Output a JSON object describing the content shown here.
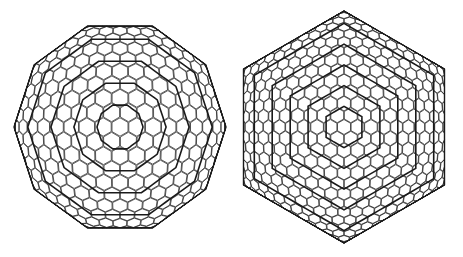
{
  "figure": {
    "background": "#ffffff",
    "line_color": "#1a1a1a",
    "panels": [
      {
        "id": "left",
        "description": "Wireframe fullerene cage, view along 5-fold axis (decagonal outline)",
        "outline": "decagon",
        "center": [
          120,
          127
        ],
        "radius": 106,
        "shells": 4
      },
      {
        "id": "right",
        "description": "Wireframe fullerene cage, view along 3-fold axis (hexagonal outline) with nested inner shells",
        "outline": "hexagon",
        "center": [
          344,
          127
        ],
        "radius": 116,
        "shells": 5
      }
    ]
  }
}
